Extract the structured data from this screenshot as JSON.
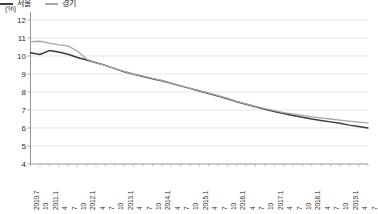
{
  "chart_data": {
    "type": "line",
    "title": "",
    "unit_label": "(%)",
    "xlabel": "",
    "ylabel": "",
    "ylim": [
      4,
      12
    ],
    "yticks": [
      12,
      11,
      10,
      9,
      8,
      7,
      6,
      5,
      4
    ],
    "grid": true,
    "legend_position": "top-right",
    "x": [
      "2010.7",
      "10",
      "2011.1",
      "4",
      "7",
      "10",
      "2012.1",
      "4",
      "7",
      "10",
      "2013.1",
      "4",
      "7",
      "10",
      "2014.1",
      "4",
      "7",
      "10",
      "2015.1",
      "4",
      "7",
      "10",
      "2016.1",
      "4",
      "7",
      "10",
      "2017.1",
      "4",
      "7",
      "10",
      "2018.1",
      "4",
      "7",
      "10",
      "2019.1",
      "4",
      "7"
    ],
    "x_tick_labels": [
      "2010.7",
      "10",
      "2011.1",
      "4",
      "7",
      "10",
      "2012.1",
      "4",
      "7",
      "10",
      "2013.1",
      "4",
      "7",
      "10",
      "2014.1",
      "4",
      "7",
      "10",
      "2015.1",
      "4",
      "7",
      "10",
      "2016.1",
      "4",
      "7",
      "10",
      "2017.1",
      "4",
      "7",
      "10",
      "2018.1",
      "4",
      "7",
      "10",
      "2019.1",
      "4",
      "7"
    ],
    "series": [
      {
        "name": "서울",
        "color": "#3c3c3c",
        "values": [
          10.18,
          10.08,
          10.3,
          10.22,
          10.1,
          9.92,
          9.78,
          9.62,
          9.48,
          9.3,
          9.12,
          8.98,
          8.86,
          8.74,
          8.62,
          8.48,
          8.34,
          8.2,
          8.06,
          7.92,
          7.78,
          7.62,
          7.46,
          7.32,
          7.18,
          7.04,
          6.92,
          6.8,
          6.7,
          6.6,
          6.5,
          6.42,
          6.34,
          6.26,
          6.16,
          6.08,
          6.0
        ]
      },
      {
        "name": "경기",
        "color": "#a6a6a6",
        "values": [
          10.8,
          10.82,
          10.72,
          10.62,
          10.56,
          10.28,
          9.82,
          9.62,
          9.46,
          9.3,
          9.14,
          9.0,
          8.88,
          8.76,
          8.64,
          8.5,
          8.36,
          8.22,
          8.08,
          7.94,
          7.8,
          7.64,
          7.48,
          7.34,
          7.2,
          7.08,
          6.96,
          6.86,
          6.78,
          6.7,
          6.62,
          6.56,
          6.5,
          6.44,
          6.38,
          6.33,
          6.28
        ]
      }
    ]
  },
  "legend": {
    "items": [
      {
        "label": "서울",
        "color": "#3c3c3c"
      },
      {
        "label": "경기",
        "color": "#a6a6a6"
      }
    ]
  }
}
